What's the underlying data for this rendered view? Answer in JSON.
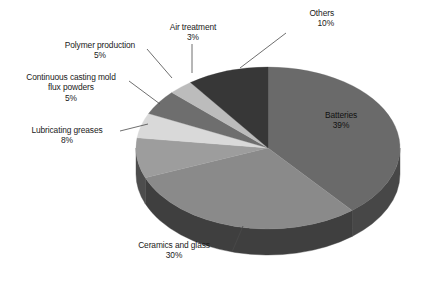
{
  "chart_data": {
    "type": "pie",
    "title": "",
    "subtitle": "",
    "xlabel": "",
    "ylabel": "",
    "legend_position": "none",
    "grid": false,
    "three_d": true,
    "value_unit": "%",
    "categories": [
      "Batteries",
      "Ceramics and glass",
      "Lubricating greases",
      "Continuous casting mold flux powders",
      "Polymer production",
      "Air treatment",
      "Others"
    ],
    "values": [
      39,
      30,
      8,
      5,
      5,
      3,
      10
    ],
    "slices": [
      {
        "label": "Batteries",
        "label_line1": "Batteries",
        "label_line2": "39%",
        "value": 39,
        "value_text": "39%",
        "color": "#6a6a6a",
        "side_color": "#474747",
        "label_placement": "inside"
      },
      {
        "label": "Ceramics and glass",
        "label_line1": "Ceramics and glass",
        "label_line2": "30%",
        "value": 30,
        "value_text": "30%",
        "color": "#8a8a8a",
        "side_color": "#3f3f3f",
        "label_placement": "outside-bottom"
      },
      {
        "label": "Lubricating greases",
        "label_line1": "Lubricating greases",
        "label_line2": "8%",
        "value": 8,
        "value_text": "8%",
        "color": "#9d9d9d",
        "side_color": "#4d4d4d",
        "label_placement": "outside-left"
      },
      {
        "label": "Continuous casting mold flux powders",
        "label_line1": "Continuous casting mold",
        "label_line2": "flux powders",
        "label_line3": "5%",
        "value": 5,
        "value_text": "5%",
        "color": "#d9d9d9",
        "side_color": "#7a7a7a",
        "label_placement": "outside-left"
      },
      {
        "label": "Polymer production",
        "label_line1": "Polymer production",
        "label_line2": "5%",
        "value": 5,
        "value_text": "5%",
        "color": "#6e6e6e",
        "side_color": "#434343",
        "label_placement": "outside-topleft"
      },
      {
        "label": "Air treatment",
        "label_line1": "Air treatment",
        "label_line2": "3%",
        "value": 3,
        "value_text": "3%",
        "color": "#bcbcbc",
        "side_color": "#6b6b6b",
        "label_placement": "outside-top"
      },
      {
        "label": "Others",
        "label_line1": "Others",
        "label_line2": "10%",
        "value": 10,
        "value_text": "10%",
        "color": "#373737",
        "side_color": "#262626",
        "label_placement": "outside-topright"
      }
    ],
    "total": 100,
    "colors": {
      "background": "#ffffff",
      "text": "#1a1a1a",
      "leader_line": "#4a4a4a"
    }
  },
  "labels": {
    "others": {
      "name": "Others",
      "pct": "10%"
    },
    "air_treatment": {
      "name": "Air treatment",
      "pct": "3%"
    },
    "polymer": {
      "name": "Polymer production",
      "pct": "5%"
    },
    "flux": {
      "name1": "Continuous casting mold",
      "name2": "flux powders",
      "pct": "5%"
    },
    "lubricating": {
      "name": "Lubricating greases",
      "pct": "8%"
    },
    "ceramics": {
      "name": "Ceramics and glass",
      "pct": "30%"
    },
    "batteries": {
      "name": "Batteries",
      "pct": "39%"
    }
  }
}
